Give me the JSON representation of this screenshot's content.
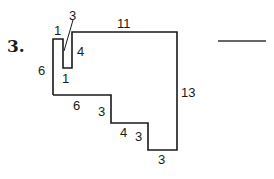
{
  "problem": {
    "number": "3.",
    "answer_blank": ""
  },
  "figure": {
    "type": "rectilinear polygon perimeter",
    "side_labels": {
      "notch_top": "1",
      "notch_slant_pointer": "3",
      "top": "11",
      "notch_inner_right": "4",
      "left": "6",
      "notch_bottom": "1",
      "right": "13",
      "bottom_left": "6",
      "step1_vertical": "3",
      "step2_horizontal": "4",
      "step2_vertical": "3",
      "bottom_right": "3"
    },
    "colors": {
      "stroke": "#1a1a1a",
      "background": "#ffffff"
    }
  }
}
